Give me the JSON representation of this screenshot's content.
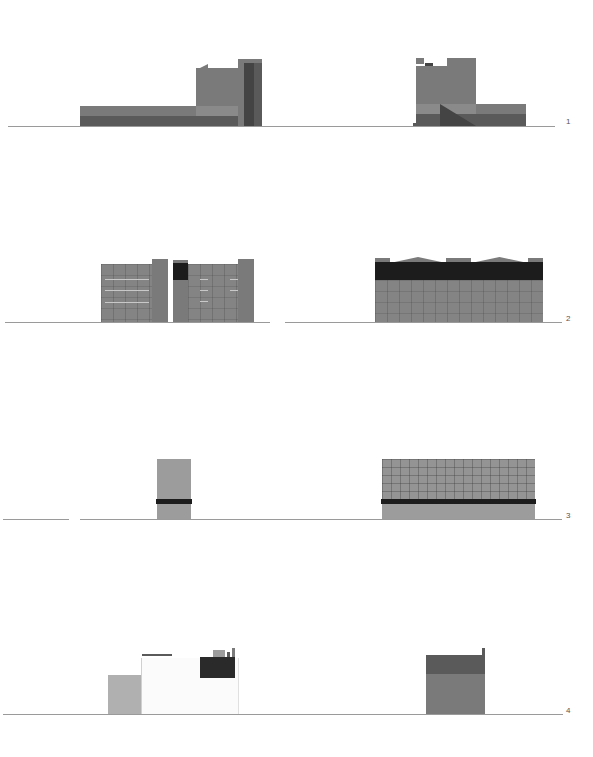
{
  "sheet": {
    "title": "Street elevations",
    "rows": [
      {
        "id": "row-1",
        "label": "1"
      },
      {
        "id": "row-2",
        "label": "2"
      },
      {
        "id": "row-3",
        "label": "3"
      },
      {
        "id": "row-4",
        "label": "4"
      }
    ]
  },
  "colors": {
    "ground_line": "#9a9a9a",
    "facade_mid": "#7a7a7a",
    "facade_dark": "#5a5a5a",
    "roof_band_black": "#1c1c1c",
    "facade_light": "#9c9c9c"
  }
}
